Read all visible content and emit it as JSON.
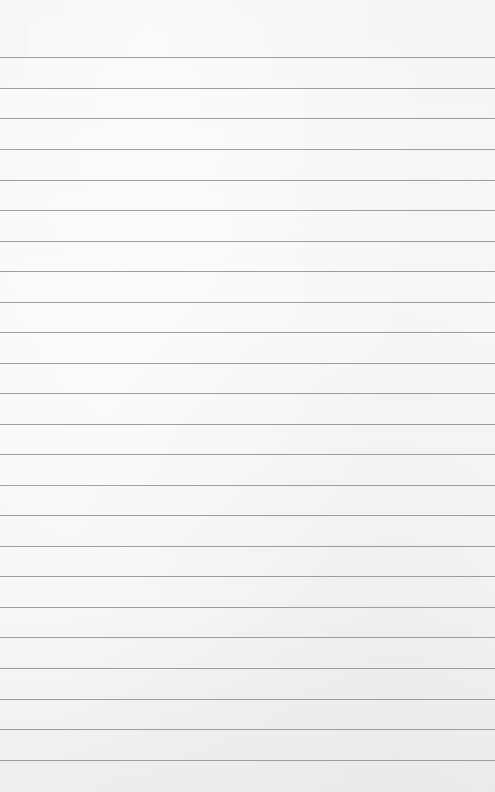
{
  "page": {
    "type": "lined-paper",
    "background_color": "#f6f6f5",
    "rule_color": "#8e8e8e",
    "rule_count": 24,
    "rule_positions_y": [
      57,
      88,
      118,
      149,
      180,
      210,
      241,
      271,
      302,
      332,
      363,
      393,
      424,
      454,
      485,
      515,
      546,
      576,
      607,
      637,
      668,
      699,
      729,
      760
    ],
    "text_lines": []
  }
}
